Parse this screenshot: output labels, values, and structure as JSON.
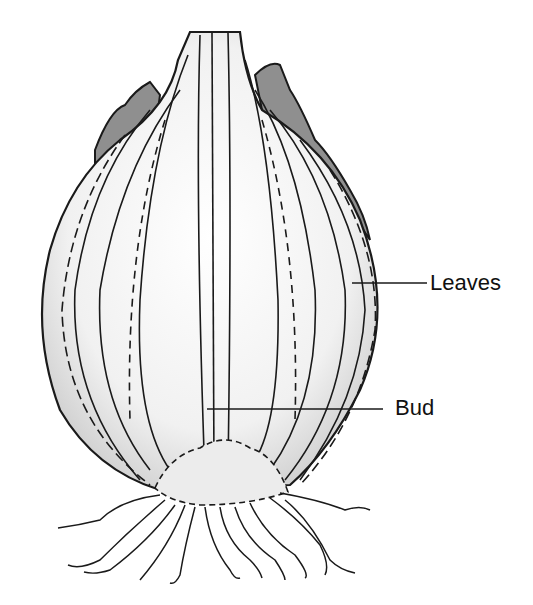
{
  "figure": {
    "labels": [
      {
        "id": "leaves",
        "text": "Leaves",
        "pointer": {
          "x1": 352,
          "y1": 283,
          "x2": 427,
          "y2": 283
        }
      },
      {
        "id": "bud",
        "text": "Bud",
        "pointer": {
          "x1": 207,
          "y1": 409,
          "x2": 383,
          "y2": 409
        }
      }
    ]
  },
  "colors": {
    "outline": "#1a1a1a",
    "shade_dark": "#8a8a8a",
    "shade_light": "#d9d9d9",
    "background": "#ffffff"
  }
}
